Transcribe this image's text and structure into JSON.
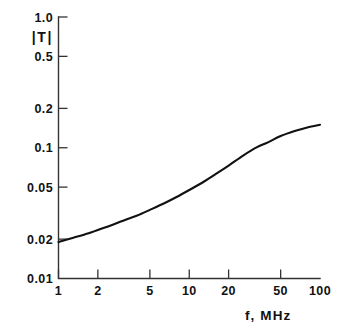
{
  "chart_data": {
    "type": "line",
    "title": "",
    "xlabel": "f, MHz",
    "ylabel": "|T|",
    "xscale": "log",
    "yscale": "log",
    "xlim": [
      1,
      100
    ],
    "ylim": [
      0.01,
      1.0
    ],
    "grid": false,
    "legend": null,
    "xticks": [
      1,
      2,
      5,
      10,
      20,
      50,
      100
    ],
    "xticklabels": [
      "1",
      "2",
      "5",
      "10",
      "20",
      "50",
      "100"
    ],
    "yticks": [
      0.01,
      0.02,
      0.05,
      0.1,
      0.2,
      0.5,
      1.0
    ],
    "yticklabels": [
      "0.01",
      "0.02",
      "0.05",
      "0.1",
      "0.2",
      "0.5",
      "1.0"
    ],
    "series": [
      {
        "name": "|T|",
        "x": [
          1,
          1.3,
          1.7,
          2,
          2.6,
          3.3,
          4,
          5,
          6.5,
          8,
          10,
          13,
          16,
          20,
          26,
          33,
          40,
          50,
          65,
          80,
          100
        ],
        "values": [
          0.019,
          0.0205,
          0.0222,
          0.0235,
          0.0258,
          0.0283,
          0.0303,
          0.0335,
          0.0378,
          0.042,
          0.0475,
          0.0552,
          0.063,
          0.073,
          0.0875,
          0.101,
          0.11,
          0.123,
          0.135,
          0.143,
          0.15
        ]
      }
    ]
  },
  "axes": {
    "ordinate_label": "|T|",
    "abscissa_label": "f, MHz"
  },
  "colors": {
    "curve": "#111111",
    "axis": "#333333",
    "background": "#ffffff"
  }
}
